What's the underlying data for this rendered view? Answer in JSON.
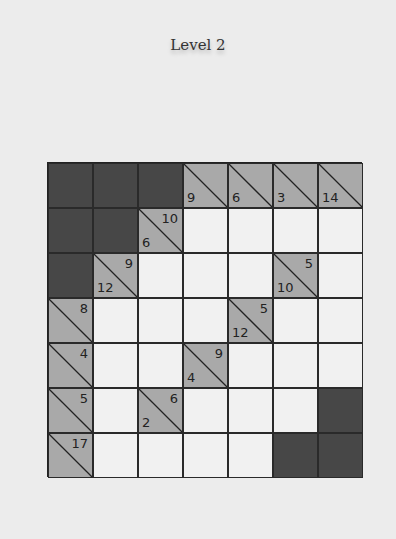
{
  "title": "Level 2",
  "colors": {
    "background": "#ececec",
    "blank_cell": "#474747",
    "clue_cell": "#a9a9a9",
    "empty_cell": "#f1f1f1",
    "grid_line": "#222222"
  },
  "grid": {
    "rows": 7,
    "cols": 7,
    "cells": [
      [
        {
          "t": "blank"
        },
        {
          "t": "blank"
        },
        {
          "t": "blank"
        },
        {
          "t": "clue",
          "down": "9"
        },
        {
          "t": "clue",
          "down": "6"
        },
        {
          "t": "clue",
          "down": "3"
        },
        {
          "t": "clue",
          "down": "14"
        }
      ],
      [
        {
          "t": "blank"
        },
        {
          "t": "blank"
        },
        {
          "t": "clue",
          "across": "10",
          "down": "6"
        },
        {
          "t": "empty"
        },
        {
          "t": "empty"
        },
        {
          "t": "empty"
        },
        {
          "t": "empty"
        }
      ],
      [
        {
          "t": "blank"
        },
        {
          "t": "clue",
          "across": "9",
          "down": "12"
        },
        {
          "t": "empty"
        },
        {
          "t": "empty"
        },
        {
          "t": "empty"
        },
        {
          "t": "clue",
          "across": "5",
          "down": "10"
        },
        {
          "t": "empty"
        }
      ],
      [
        {
          "t": "clue",
          "across": "8"
        },
        {
          "t": "empty"
        },
        {
          "t": "empty"
        },
        {
          "t": "empty"
        },
        {
          "t": "clue",
          "across": "5",
          "down": "12"
        },
        {
          "t": "empty"
        },
        {
          "t": "empty"
        }
      ],
      [
        {
          "t": "clue",
          "across": "4"
        },
        {
          "t": "empty"
        },
        {
          "t": "empty"
        },
        {
          "t": "clue",
          "across": "9",
          "down": "4"
        },
        {
          "t": "empty"
        },
        {
          "t": "empty"
        },
        {
          "t": "empty"
        }
      ],
      [
        {
          "t": "clue",
          "across": "5"
        },
        {
          "t": "empty"
        },
        {
          "t": "clue",
          "across": "6",
          "down": "2"
        },
        {
          "t": "empty"
        },
        {
          "t": "empty"
        },
        {
          "t": "empty"
        },
        {
          "t": "blank"
        }
      ],
      [
        {
          "t": "clue",
          "across": "17"
        },
        {
          "t": "empty"
        },
        {
          "t": "empty"
        },
        {
          "t": "empty"
        },
        {
          "t": "empty"
        },
        {
          "t": "blank"
        },
        {
          "t": "blank"
        }
      ]
    ]
  }
}
